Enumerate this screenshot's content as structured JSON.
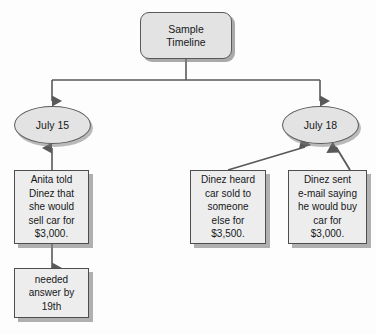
{
  "diagram": {
    "type": "flowchart",
    "title": "Sample Timeline",
    "background_color": "#fdfdfd",
    "node_fill_color": "#e3e3e3",
    "box_fill_color": "#ededed",
    "border_color": "#4e4e4e",
    "shadow_color": "#7d7d7d",
    "text_color": "#16181a",
    "nodes": {
      "root": {
        "label": "Sample\nTimeline",
        "shape": "rounded-rectangle"
      },
      "date_left": {
        "label": "July 15",
        "shape": "ellipse"
      },
      "date_right": {
        "label": "July 18",
        "shape": "ellipse"
      },
      "event_anita": {
        "label": "Anita told\nDinez that\nshe would\nsell car for\n$3,000.",
        "shape": "rectangle"
      },
      "event_needed": {
        "label": "needed\nanswer by\n19th",
        "shape": "rectangle"
      },
      "event_heard": {
        "label": "Dinez heard\ncar sold to\nsomeone\nelse for\n$3,500.",
        "shape": "rectangle"
      },
      "event_sent": {
        "label": "Dinez sent\ne-mail saying\nhe would buy\ncar for\n$3,000.",
        "shape": "rectangle"
      }
    },
    "edges": [
      {
        "from": "root",
        "to": "date_left",
        "direction": "down"
      },
      {
        "from": "root",
        "to": "date_right",
        "direction": "down"
      },
      {
        "from": "event_anita",
        "to": "date_left",
        "direction": "up"
      },
      {
        "from": "event_anita",
        "to": "event_needed",
        "direction": "down"
      },
      {
        "from": "event_heard",
        "to": "date_right",
        "direction": "up"
      },
      {
        "from": "event_sent",
        "to": "date_right",
        "direction": "up"
      }
    ]
  }
}
